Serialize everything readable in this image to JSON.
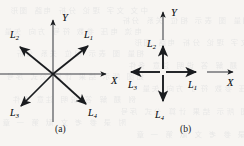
{
  "figure": {
    "background_color": "#f7f5f2",
    "ink_color": "#1a1c1f",
    "panels": [
      {
        "id": "panel-a",
        "caption": "(a)",
        "caption_pos": [
          58,
          126
        ],
        "origin": [
          53,
          74
        ],
        "axes": [
          {
            "name": "x-axis",
            "label": "X",
            "label_pos": [
              112,
              75
            ],
            "from": [
              0,
              74
            ],
            "to": [
              108,
              74
            ],
            "arrow": true
          },
          {
            "name": "y-axis",
            "label": "Y",
            "label_pos": [
              62,
              13
            ],
            "from": [
              53,
              120
            ],
            "to": [
              53,
              18
            ],
            "arrow": true
          }
        ],
        "vectors": [
          {
            "name": "L1",
            "label": "L",
            "sub": "1",
            "label_pos": [
              84,
              32
            ],
            "to": [
              89,
              46
            ],
            "angle_deg": 30
          },
          {
            "name": "L2",
            "label": "L",
            "sub": "2",
            "label_pos": [
              11,
              31
            ],
            "to": [
              18,
              46
            ],
            "angle_deg": 150
          },
          {
            "name": "L3",
            "label": "L",
            "sub": "3",
            "label_pos": [
              12,
              110
            ],
            "to": [
              18,
              102
            ],
            "angle_deg": 210
          },
          {
            "name": "L4",
            "label": "L",
            "sub": "4",
            "label_pos": [
              89,
              110
            ],
            "to": [
              89,
              102
            ],
            "angle_deg": 330
          }
        ]
      },
      {
        "id": "panel-b",
        "caption": "(b)",
        "caption_pos": [
          183,
          126
        ],
        "origin": [
          163,
          72
        ],
        "axes": [
          {
            "name": "x-axis",
            "label": "X",
            "label_pos": [
              228,
              78
            ],
            "from": [
              208,
              72
            ],
            "to": [
              234,
              72
            ],
            "arrow": true
          },
          {
            "name": "y-axis",
            "label": "Y",
            "label_pos": [
              172,
              8
            ],
            "from": [
              163,
              38
            ],
            "to": [
              163,
              10
            ],
            "arrow": true
          }
        ],
        "vectors": [
          {
            "name": "L1",
            "label": "L",
            "sub": "1",
            "label_pos": [
              190,
              81
            ],
            "to": [
              197,
              72
            ],
            "angle_deg": 0
          },
          {
            "name": "L2",
            "label": "L",
            "sub": "2",
            "label_pos": [
              148,
              40
            ],
            "to": [
              163,
              45
            ],
            "angle_deg": 90
          },
          {
            "name": "L3",
            "label": "L",
            "sub": "3",
            "label_pos": [
              129,
              82
            ],
            "to": [
              130,
              72
            ],
            "angle_deg": 180
          },
          {
            "name": "L4",
            "label": "L",
            "sub": "4",
            "label_pos": [
              156,
              114
            ],
            "to": [
              163,
              102
            ],
            "angle_deg": 270
          }
        ]
      }
    ]
  },
  "bleed_text": [
    "中文 文字 理论 分析 电路 图形",
    "电流 电压 参数 符号 方向 矢量",
    "相量 图 表示 相位 关系 分析",
    "如图 所示 结果 计算 公式 序号",
    "例 题 解 答 说明 注意 条件",
    "附 录 参 考 文 献 第 一 章"
  ]
}
